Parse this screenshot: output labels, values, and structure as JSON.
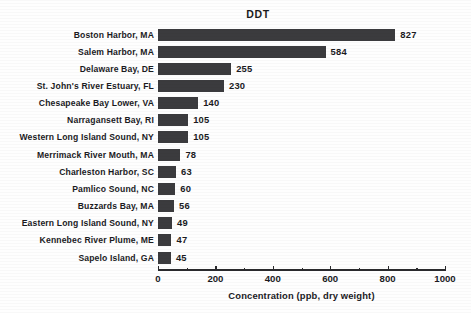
{
  "chart_data": {
    "type": "bar",
    "orientation": "horizontal",
    "title": "DDT",
    "xlabel": "Concentration (ppb, dry weight)",
    "ylabel": "",
    "xlim": [
      0,
      1000
    ],
    "xticks": [
      0,
      200,
      400,
      600,
      800,
      1000
    ],
    "xtick_labels": [
      "0",
      "200",
      "400",
      "600",
      "800",
      "1000"
    ],
    "minor_ticks": [
      100,
      300,
      500,
      700,
      900
    ],
    "grid": false,
    "legend": false,
    "bar_color": "#3b3b3e",
    "background_color": "#fefefe",
    "show_value_labels": true,
    "categories": [
      "Boston Harbor, MA",
      "Salem Harbor, MA",
      "Delaware Bay, DE",
      "St. John's River Estuary, FL",
      "Chesapeake Bay Lower, VA",
      "Narragansett Bay, RI",
      "Western Long Island Sound, NY",
      "Merrimack River Mouth, MA",
      "Charleston Harbor, SC",
      "Pamlico Sound, NC",
      "Buzzards Bay, MA",
      "Eastern Long Island Sound, NY",
      "Kennebec River Plume, ME",
      "Sapelo Island, GA"
    ],
    "values": [
      827,
      584,
      255,
      230,
      140,
      105,
      105,
      78,
      63,
      60,
      56,
      49,
      47,
      45
    ],
    "value_labels": [
      "827",
      "584",
      "255",
      "230",
      "140",
      "105",
      "105",
      "78",
      "63",
      "60",
      "56",
      "49",
      "47",
      "45"
    ]
  }
}
